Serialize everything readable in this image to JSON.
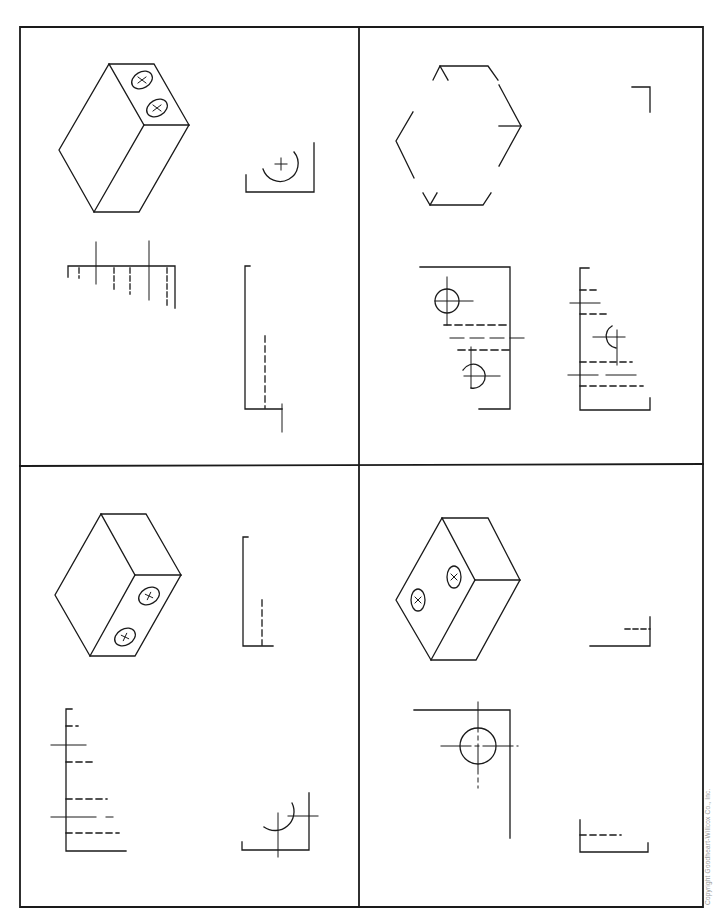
{
  "page": {
    "type": "technical-drawing-worksheet",
    "copyright": "Copyright Goodheart-Willcox Co., Inc.",
    "line_color": "#1a1a1a",
    "background": "#ffffff"
  },
  "panels": [
    {
      "id": 1,
      "position": "top-left",
      "pictorial": {
        "type": "isometric-block",
        "holes": 2,
        "hole_face": "top",
        "hole_marker": "x"
      },
      "views": [
        "top-view-partial-with-arc",
        "front-view-partial-hidden-lines",
        "side-view-partial-hidden-line"
      ]
    },
    {
      "id": 2,
      "position": "top-right",
      "pictorial": {
        "type": "isometric-block-incomplete",
        "holes": 0
      },
      "views": [
        "corner-mark",
        "front-view-with-holes",
        "side-view-hidden-lines"
      ]
    },
    {
      "id": 3,
      "position": "bottom-left",
      "pictorial": {
        "type": "isometric-block",
        "holes": 2,
        "hole_face": "right",
        "hole_marker": "+"
      },
      "views": [
        "side-view-partial-hidden-line",
        "front-view-hidden-lines",
        "top-view-partial-with-arc"
      ]
    },
    {
      "id": 4,
      "position": "bottom-right",
      "pictorial": {
        "type": "isometric-block",
        "holes": 2,
        "hole_face": "left",
        "hole_marker": "x"
      },
      "views": [
        "corner-hidden-line",
        "front-view-with-circle",
        "side-view-partial-hidden-line"
      ]
    }
  ]
}
